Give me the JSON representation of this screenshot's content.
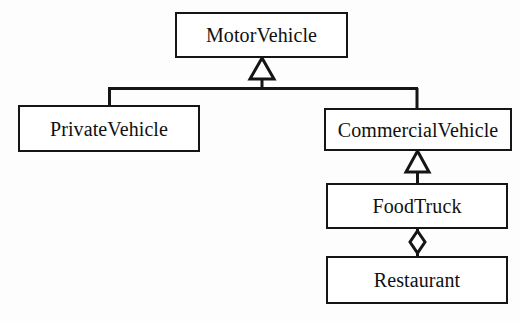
{
  "diagram": {
    "kind": "uml-class-diagram",
    "background_color": "#fdfdfd",
    "line_color": "#151515",
    "fill_color": "#ffffff",
    "nodes": [
      {
        "id": "motorvehicle",
        "label": "MotorVehicle",
        "x": 175,
        "y": 12,
        "w": 173,
        "h": 46
      },
      {
        "id": "privatevehicle",
        "label": "PrivateVehicle",
        "x": 18,
        "y": 105,
        "w": 182,
        "h": 47
      },
      {
        "id": "commercialvehicle",
        "label": "CommercialVehicle",
        "x": 324,
        "y": 108,
        "w": 188,
        "h": 43
      },
      {
        "id": "foodtruck",
        "label": "FoodTruck",
        "x": 326,
        "y": 183,
        "w": 182,
        "h": 46
      },
      {
        "id": "restaurant",
        "label": "Restaurant",
        "x": 326,
        "y": 256,
        "w": 182,
        "h": 48
      }
    ],
    "edges": [
      {
        "id": "gen-private-to-motor",
        "type": "generalization",
        "from": "privatevehicle",
        "to": "motorvehicle",
        "marker": "hollow-triangle"
      },
      {
        "id": "gen-commercial-to-motor",
        "type": "generalization",
        "from": "commercialvehicle",
        "to": "motorvehicle",
        "marker": "hollow-triangle"
      },
      {
        "id": "gen-foodtruck-to-commercial",
        "type": "generalization",
        "from": "foodtruck",
        "to": "commercialvehicle",
        "marker": "hollow-triangle"
      },
      {
        "id": "agg-restaurant-foodtruck",
        "type": "aggregation",
        "from": "foodtruck",
        "to": "restaurant",
        "marker": "hollow-diamond"
      }
    ]
  }
}
